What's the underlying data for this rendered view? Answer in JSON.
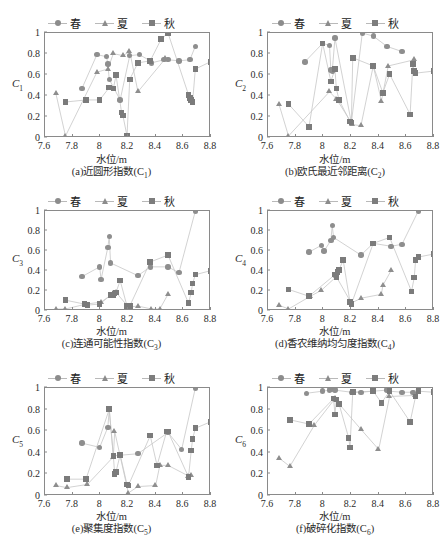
{
  "figure": {
    "axis_x_label": "水位/m",
    "legend": [
      {
        "name": "spring",
        "label": "春",
        "marker": "circle"
      },
      {
        "name": "summer",
        "label": "夏",
        "marker": "triangle"
      },
      {
        "name": "autumn",
        "label": "秋",
        "marker": "square"
      }
    ],
    "colors": {
      "marker_circle": "#8e8e8e",
      "marker_triangle": "#8e8e8e",
      "marker_square": "#7b7b7b",
      "line": "#c6c6c6",
      "frame": "#8a8a8a",
      "background": "#ffffff",
      "text": "#2b2b2b"
    },
    "xticks": [
      "7.6",
      "7.8",
      "8",
      "8.2",
      "8.4",
      "8.6",
      "8.8"
    ],
    "yticks": [
      "0",
      "0.2",
      "0.4",
      "0.6",
      "0.8",
      "1"
    ]
  },
  "chart_data": [
    {
      "type": "scatter",
      "id": "a",
      "caption": "(a)近圆形指数(C₁)",
      "caption_main": "(a)近圆形指数(C",
      "caption_sub": "1",
      "caption_tail": ")",
      "title": "近圆形指数",
      "ylabel": "C",
      "ylabel_sub": "1",
      "xlabel": "水位/m",
      "xlim": [
        7.6,
        8.8
      ],
      "ylim": [
        0,
        1
      ],
      "grid": false,
      "legend_position": "top-center",
      "series": [
        {
          "name": "春",
          "marker": "circle",
          "x": [
            7.87,
            7.98,
            8.05,
            8.06,
            8.07,
            8.15,
            8.22,
            8.29,
            8.37,
            8.38,
            8.47,
            8.5,
            8.58,
            8.66,
            8.7
          ],
          "y": [
            0.46,
            0.79,
            0.77,
            0.7,
            0.55,
            0.35,
            0.78,
            0.79,
            0.73,
            0.71,
            0.74,
            0.74,
            0.73,
            0.74,
            0.87
          ]
        },
        {
          "name": "夏",
          "marker": "triangle",
          "x": [
            7.68,
            7.75,
            7.98,
            8.06,
            8.1,
            8.17,
            8.22,
            8.28,
            8.48
          ],
          "y": [
            0.41,
            0.0,
            0.62,
            0.65,
            0.8,
            0.78,
            0.82,
            0.43,
            0.75
          ]
        },
        {
          "name": "秋",
          "marker": "square",
          "x": [
            7.75,
            7.9,
            8.0,
            8.07,
            8.1,
            8.12,
            8.16,
            8.17,
            8.2,
            8.22,
            8.28,
            8.37,
            8.45,
            8.5,
            8.65,
            8.66,
            8.67,
            8.68,
            8.7,
            8.81
          ],
          "y": [
            0.33,
            0.35,
            0.35,
            0.47,
            0.46,
            0.59,
            0.23,
            0.2,
            0.0,
            0.55,
            0.71,
            0.73,
            0.94,
            1.0,
            0.4,
            0.37,
            0.35,
            0.33,
            0.65,
            0.72
          ]
        }
      ]
    },
    {
      "type": "scatter",
      "id": "b",
      "caption": "(b)欧氏最近邻距离(C₂)",
      "caption_main": "(b)欧氏最近邻距离(C",
      "caption_sub": "2",
      "caption_tail": ")",
      "title": "欧氏最近邻距离",
      "ylabel": "C",
      "ylabel_sub": "2",
      "xlabel": "水位/m",
      "xlim": [
        7.6,
        8.8
      ],
      "ylim": [
        0,
        1
      ],
      "grid": false,
      "legend_position": "top-center",
      "series": [
        {
          "name": "春",
          "marker": "circle",
          "x": [
            7.87,
            8.0,
            8.05,
            8.06,
            8.07,
            8.09,
            8.21,
            8.29,
            8.37,
            8.47,
            8.58
          ],
          "y": [
            0.72,
            0.9,
            0.88,
            0.64,
            0.63,
            0.95,
            0.13,
            1.0,
            0.97,
            0.87,
            0.82
          ]
        },
        {
          "name": "夏",
          "marker": "triangle",
          "x": [
            7.68,
            7.75,
            8.05,
            8.1,
            8.22,
            8.28,
            8.37,
            8.43,
            8.48,
            8.67
          ],
          "y": [
            0.31,
            0.0,
            0.43,
            0.36,
            0.11,
            0.1,
            0.68,
            0.34,
            0.68,
            0.74
          ]
        },
        {
          "name": "秋",
          "marker": "square",
          "x": [
            7.75,
            7.9,
            8.0,
            8.06,
            8.09,
            8.1,
            8.12,
            8.2,
            8.21,
            8.22,
            8.37,
            8.44,
            8.49,
            8.64,
            8.66,
            8.67,
            8.68,
            8.81
          ],
          "y": [
            0.31,
            0.09,
            0.9,
            0.53,
            0.65,
            0.46,
            0.35,
            0.14,
            0.13,
            0.76,
            0.68,
            0.42,
            0.6,
            0.21,
            0.7,
            0.63,
            0.61,
            0.63
          ]
        }
      ]
    },
    {
      "type": "scatter",
      "id": "c",
      "caption": "(c)连通可能性指数(C₃)",
      "caption_main": "(c)连通可能性指数(C",
      "caption_sub": "3",
      "caption_tail": ")",
      "title": "连通可能性指数",
      "ylabel": "C",
      "ylabel_sub": "3",
      "xlabel": "水位/m",
      "xlim": [
        7.6,
        8.8
      ],
      "ylim": [
        0,
        1
      ],
      "grid": false,
      "legend_position": "top-center",
      "series": [
        {
          "name": "春",
          "marker": "circle",
          "x": [
            7.87,
            8.0,
            8.01,
            8.06,
            8.07,
            8.08,
            8.28,
            8.37,
            8.5,
            8.58,
            8.7
          ],
          "y": [
            0.33,
            0.43,
            0.3,
            0.63,
            0.74,
            0.47,
            0.34,
            0.43,
            0.43,
            0.37,
            1.0
          ]
        },
        {
          "name": "夏",
          "marker": "triangle",
          "x": [
            7.68,
            7.75,
            7.9,
            8.01,
            8.1,
            8.12,
            8.21,
            8.28,
            8.38,
            8.44,
            8.5
          ],
          "y": [
            0.0,
            0.0,
            0.05,
            0.07,
            0.16,
            0.17,
            0.02,
            0.03,
            0.0,
            0.0,
            0.15
          ]
        },
        {
          "name": "秋",
          "marker": "square",
          "x": [
            7.75,
            7.89,
            7.91,
            8.0,
            8.08,
            8.1,
            8.11,
            8.12,
            8.15,
            8.2,
            8.22,
            8.37,
            8.5,
            8.65,
            8.67,
            8.68,
            8.7,
            8.81
          ],
          "y": [
            0.09,
            0.05,
            0.04,
            0.05,
            0.14,
            0.14,
            0.16,
            0.17,
            0.29,
            0.03,
            0.03,
            0.48,
            0.55,
            0.06,
            0.17,
            0.26,
            0.35,
            0.39
          ]
        }
      ]
    },
    {
      "type": "scatter",
      "id": "d",
      "caption": "(d)香农维纳均匀度指数(C₄)",
      "caption_main": "(d)香农维纳均匀度指数(C",
      "caption_sub": "4",
      "caption_tail": ")",
      "title": "香农维纳均匀度指数",
      "ylabel": "C",
      "ylabel_sub": "4",
      "xlabel": "水位/m",
      "xlim": [
        7.6,
        8.8
      ],
      "ylim": [
        0,
        1
      ],
      "grid": false,
      "legend_position": "top-center",
      "series": [
        {
          "name": "春",
          "marker": "circle",
          "x": [
            7.9,
            7.99,
            8.01,
            8.06,
            8.07,
            8.08,
            8.28,
            8.37,
            8.5,
            8.58,
            8.7
          ],
          "y": [
            0.58,
            0.65,
            0.59,
            0.7,
            0.85,
            0.73,
            0.55,
            0.67,
            0.64,
            0.66,
            1.0
          ]
        },
        {
          "name": "夏",
          "marker": "triangle",
          "x": [
            7.68,
            7.75,
            7.91,
            7.99,
            8.1,
            8.21,
            8.28,
            8.43,
            8.44,
            8.5
          ],
          "y": [
            0.04,
            0.0,
            0.13,
            0.19,
            0.33,
            0.06,
            0.11,
            0.15,
            0.24,
            0.39
          ]
        },
        {
          "name": "秋",
          "marker": "square",
          "x": [
            7.75,
            7.9,
            8.09,
            8.1,
            8.11,
            8.12,
            8.15,
            8.2,
            8.21,
            8.37,
            8.49,
            8.65,
            8.67,
            8.68,
            8.7,
            8.81
          ],
          "y": [
            0.2,
            0.13,
            0.35,
            0.32,
            0.38,
            0.4,
            0.5,
            0.07,
            0.05,
            0.67,
            0.73,
            0.18,
            0.32,
            0.5,
            0.53,
            0.56
          ]
        }
      ]
    },
    {
      "type": "scatter",
      "id": "e",
      "caption": "(e)聚集度指数(C₅)",
      "caption_main": "(e)聚集度指数(C",
      "caption_sub": "5",
      "caption_tail": ")",
      "title": "聚集度指数",
      "ylabel": "C",
      "ylabel_sub": "5",
      "xlabel": "水位/m",
      "xlim": [
        7.6,
        8.8
      ],
      "ylim": [
        0,
        1
      ],
      "grid": false,
      "legend_position": "top-center",
      "series": [
        {
          "name": "春",
          "marker": "circle",
          "x": [
            7.87,
            8.0,
            8.06,
            8.07,
            8.1,
            8.28,
            8.5,
            8.6,
            8.7
          ],
          "y": [
            0.48,
            0.44,
            0.63,
            0.8,
            0.36,
            0.38,
            0.58,
            0.42,
            1.0
          ]
        },
        {
          "name": "夏",
          "marker": "triangle",
          "x": [
            7.68,
            7.76,
            7.91,
            8.1,
            8.11,
            8.21,
            8.28,
            8.41,
            8.44,
            8.5,
            8.65,
            8.67
          ],
          "y": [
            0.08,
            0.06,
            0.09,
            0.35,
            0.59,
            0.01,
            0.07,
            0.08,
            0.27,
            0.27,
            0.17,
            0.18
          ]
        },
        {
          "name": "秋",
          "marker": "square",
          "x": [
            7.76,
            7.9,
            8.07,
            8.1,
            8.11,
            8.12,
            8.15,
            8.2,
            8.21,
            8.37,
            8.42,
            8.49,
            8.5,
            8.65,
            8.67,
            8.68,
            8.7,
            8.81
          ],
          "y": [
            0.14,
            0.14,
            0.8,
            0.36,
            0.19,
            0.21,
            0.37,
            0.09,
            0.08,
            0.55,
            0.27,
            0.59,
            0.59,
            0.16,
            0.41,
            0.52,
            0.62,
            0.68
          ]
        }
      ]
    },
    {
      "type": "scatter",
      "id": "f",
      "caption": "(f)破碎化指数(C₆)",
      "caption_main": "(f)破碎化指数(C",
      "caption_sub": "6",
      "caption_tail": ")",
      "title": "破碎化指数",
      "ylabel": "C",
      "ylabel_sub": "6",
      "xlabel": "水位/m",
      "xlim": [
        7.6,
        8.8
      ],
      "ylim": [
        0,
        1
      ],
      "grid": false,
      "legend_position": "top-center",
      "series": [
        {
          "name": "春",
          "marker": "circle",
          "x": [
            7.88,
            8.0,
            8.05,
            8.06,
            8.07,
            8.09,
            8.21,
            8.28,
            8.37,
            8.47,
            8.49,
            8.58,
            8.66,
            8.7
          ],
          "y": [
            0.95,
            0.97,
            0.98,
            0.99,
            1.0,
            0.98,
            0.96,
            0.96,
            0.97,
            0.98,
            0.97,
            0.96,
            0.96,
            1.0
          ]
        },
        {
          "name": "夏",
          "marker": "triangle",
          "x": [
            7.68,
            7.76,
            7.94,
            8.09,
            8.1,
            8.28,
            8.41,
            8.49,
            8.68
          ],
          "y": [
            0.34,
            0.26,
            0.65,
            0.9,
            0.88,
            0.61,
            0.42,
            0.92,
            0.93
          ]
        },
        {
          "name": "秋",
          "marker": "square",
          "x": [
            7.76,
            7.9,
            8.08,
            8.09,
            8.1,
            8.12,
            8.19,
            8.2,
            8.22,
            8.37,
            8.43,
            8.49,
            8.64,
            8.68,
            8.7,
            8.81
          ],
          "y": [
            0.7,
            0.66,
            0.9,
            0.75,
            0.89,
            0.85,
            0.53,
            0.44,
            0.96,
            0.97,
            0.86,
            0.97,
            0.68,
            0.92,
            0.97,
            0.96
          ]
        }
      ]
    }
  ]
}
